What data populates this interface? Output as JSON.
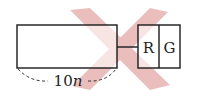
{
  "diagram": {
    "dimension_label_num": "10",
    "dimension_label_var": "n",
    "box_labels": [
      "R",
      "G"
    ],
    "watermark_color": "#d98a86",
    "line_color": "#1a1a1a"
  }
}
